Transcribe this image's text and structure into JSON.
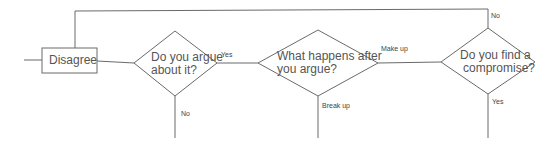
{
  "diagram": {
    "type": "flowchart",
    "nodes": [
      {
        "id": "disagree",
        "shape": "rectangle",
        "label": "Disagree"
      },
      {
        "id": "argue",
        "shape": "diamond",
        "label_line1": "Do you argue",
        "label_line2": "about it?"
      },
      {
        "id": "after",
        "shape": "diamond",
        "label_line1": "What happens after",
        "label_line2": "you argue?"
      },
      {
        "id": "compromise",
        "shape": "diamond",
        "label_line1": "Do you find a",
        "label_line2": "compromise?"
      }
    ],
    "edges": [
      {
        "from": "start",
        "to": "disagree",
        "label": ""
      },
      {
        "from": "disagree",
        "to": "argue",
        "label": ""
      },
      {
        "from": "argue",
        "to": "after",
        "label": "Yes"
      },
      {
        "from": "argue",
        "to": "end-no",
        "label": "No"
      },
      {
        "from": "after",
        "to": "compromise",
        "label": "Make up"
      },
      {
        "from": "after",
        "to": "end-breakup",
        "label": "Break up"
      },
      {
        "from": "compromise",
        "to": "disagree",
        "label": "No"
      },
      {
        "from": "compromise",
        "to": "end-yes",
        "label": "Yes"
      }
    ],
    "colors": {
      "stroke": "#6a6a6a",
      "text": "#555555",
      "background": "#ffffff"
    }
  }
}
